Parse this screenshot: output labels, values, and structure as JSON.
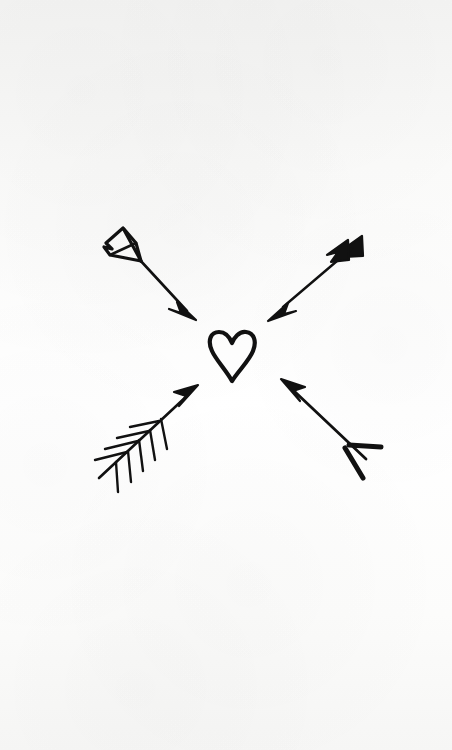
{
  "artwork": {
    "title": "Four arrows pointing inward at a heart",
    "medium": "pen and ink line drawing on paper",
    "background_color": "#f8f8f7",
    "ink_color": "#111111",
    "canvas": {
      "width": 452,
      "height": 750
    }
  },
  "elements": {
    "heart": {
      "name": "heart",
      "style": "outline",
      "filled": false,
      "stroke_width": 4,
      "center_x": 232,
      "center_y": 355,
      "width": 46,
      "height": 50
    },
    "arrows": [
      {
        "name": "arrow-top-left",
        "direction": "down-right",
        "fletching": "outlined-feather",
        "head": "solid-triangle",
        "tail_x": 108,
        "tail_y": 228,
        "tip_x": 196,
        "tip_y": 320
      },
      {
        "name": "arrow-top-right",
        "direction": "down-left",
        "fletching": "solid-double-chevron",
        "head": "solid-triangle",
        "tail_x": 360,
        "tail_y": 237,
        "tip_x": 268,
        "tip_y": 320
      },
      {
        "name": "arrow-bottom-left",
        "direction": "up-right",
        "fletching": "barbed-feather",
        "head": "solid-triangle",
        "tail_x": 99,
        "tail_y": 478,
        "tip_x": 198,
        "tip_y": 385
      },
      {
        "name": "arrow-bottom-right",
        "direction": "up-left",
        "fletching": "open-v-nock",
        "head": "solid-triangle",
        "tail_x": 378,
        "tail_y": 470,
        "tip_x": 281,
        "tip_y": 379
      }
    ]
  }
}
